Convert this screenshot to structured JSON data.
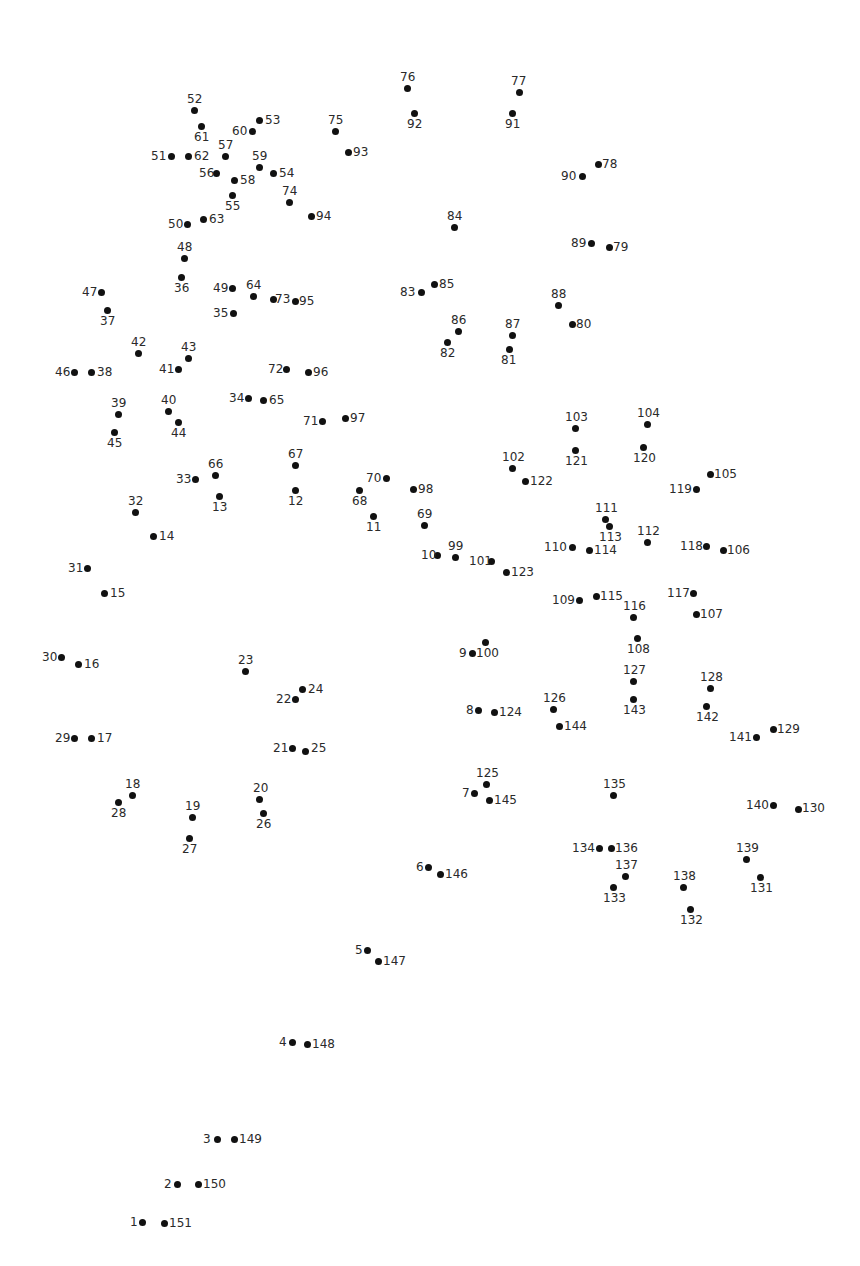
{
  "dot_count": 151,
  "dots": [
    {
      "n": "1",
      "x": 142,
      "y": 1222,
      "lx": 130,
      "ly": 1216
    },
    {
      "n": "2",
      "x": 177,
      "y": 1184,
      "lx": 164,
      "ly": 1178
    },
    {
      "n": "3",
      "x": 217,
      "y": 1139,
      "lx": 203,
      "ly": 1133
    },
    {
      "n": "4",
      "x": 292,
      "y": 1042,
      "lx": 279,
      "ly": 1036
    },
    {
      "n": "5",
      "x": 367,
      "y": 950,
      "lx": 355,
      "ly": 944
    },
    {
      "n": "6",
      "x": 428,
      "y": 867,
      "lx": 416,
      "ly": 861
    },
    {
      "n": "7",
      "x": 474,
      "y": 793,
      "lx": 462,
      "ly": 787
    },
    {
      "n": "8",
      "x": 478,
      "y": 710,
      "lx": 466,
      "ly": 704
    },
    {
      "n": "9",
      "x": 472,
      "y": 653,
      "lx": 459,
      "ly": 647
    },
    {
      "n": "10",
      "x": 437,
      "y": 555,
      "lx": 421,
      "ly": 549
    },
    {
      "n": "11",
      "x": 373,
      "y": 516,
      "lx": 366,
      "ly": 521
    },
    {
      "n": "12",
      "x": 295,
      "y": 490,
      "lx": 288,
      "ly": 495
    },
    {
      "n": "13",
      "x": 219,
      "y": 496,
      "lx": 212,
      "ly": 501
    },
    {
      "n": "14",
      "x": 153,
      "y": 536,
      "lx": 159,
      "ly": 530
    },
    {
      "n": "15",
      "x": 104,
      "y": 593,
      "lx": 110,
      "ly": 587
    },
    {
      "n": "16",
      "x": 78,
      "y": 664,
      "lx": 84,
      "ly": 658
    },
    {
      "n": "17",
      "x": 91,
      "y": 738,
      "lx": 97,
      "ly": 732
    },
    {
      "n": "18",
      "x": 132,
      "y": 795,
      "lx": 125,
      "ly": 778
    },
    {
      "n": "19",
      "x": 192,
      "y": 817,
      "lx": 185,
      "ly": 800
    },
    {
      "n": "20",
      "x": 259,
      "y": 799,
      "lx": 253,
      "ly": 782
    },
    {
      "n": "21",
      "x": 292,
      "y": 748,
      "lx": 273,
      "ly": 742
    },
    {
      "n": "22",
      "x": 295,
      "y": 699,
      "lx": 276,
      "ly": 693
    },
    {
      "n": "23",
      "x": 245,
      "y": 671,
      "lx": 238,
      "ly": 654
    },
    {
      "n": "24",
      "x": 302,
      "y": 689,
      "lx": 308,
      "ly": 683
    },
    {
      "n": "25",
      "x": 305,
      "y": 751,
      "lx": 311,
      "ly": 742
    },
    {
      "n": "26",
      "x": 263,
      "y": 813,
      "lx": 256,
      "ly": 818
    },
    {
      "n": "27",
      "x": 189,
      "y": 838,
      "lx": 182,
      "ly": 843
    },
    {
      "n": "28",
      "x": 118,
      "y": 802,
      "lx": 111,
      "ly": 807
    },
    {
      "n": "29",
      "x": 74,
      "y": 738,
      "lx": 55,
      "ly": 732
    },
    {
      "n": "30",
      "x": 61,
      "y": 657,
      "lx": 42,
      "ly": 651
    },
    {
      "n": "31",
      "x": 87,
      "y": 568,
      "lx": 68,
      "ly": 562
    },
    {
      "n": "32",
      "x": 135,
      "y": 512,
      "lx": 128,
      "ly": 495
    },
    {
      "n": "33",
      "x": 195,
      "y": 479,
      "lx": 176,
      "ly": 473
    },
    {
      "n": "34",
      "x": 248,
      "y": 398,
      "lx": 229,
      "ly": 392
    },
    {
      "n": "35",
      "x": 233,
      "y": 313,
      "lx": 213,
      "ly": 307
    },
    {
      "n": "36",
      "x": 181,
      "y": 277,
      "lx": 174,
      "ly": 282
    },
    {
      "n": "37",
      "x": 107,
      "y": 310,
      "lx": 100,
      "ly": 315
    },
    {
      "n": "38",
      "x": 91,
      "y": 372,
      "lx": 97,
      "ly": 366
    },
    {
      "n": "39",
      "x": 118,
      "y": 414,
      "lx": 111,
      "ly": 397
    },
    {
      "n": "40",
      "x": 168,
      "y": 411,
      "lx": 161,
      "ly": 394
    },
    {
      "n": "41",
      "x": 178,
      "y": 369,
      "lx": 159,
      "ly": 363
    },
    {
      "n": "42",
      "x": 138,
      "y": 353,
      "lx": 131,
      "ly": 336
    },
    {
      "n": "43",
      "x": 188,
      "y": 358,
      "lx": 181,
      "ly": 341
    },
    {
      "n": "44",
      "x": 178,
      "y": 422,
      "lx": 171,
      "ly": 427
    },
    {
      "n": "45",
      "x": 114,
      "y": 432,
      "lx": 107,
      "ly": 437
    },
    {
      "n": "46",
      "x": 74,
      "y": 372,
      "lx": 55,
      "ly": 366
    },
    {
      "n": "47",
      "x": 101,
      "y": 292,
      "lx": 82,
      "ly": 286
    },
    {
      "n": "48",
      "x": 184,
      "y": 258,
      "lx": 177,
      "ly": 241
    },
    {
      "n": "49",
      "x": 232,
      "y": 288,
      "lx": 213,
      "ly": 282
    },
    {
      "n": "50",
      "x": 187,
      "y": 224,
      "lx": 168,
      "ly": 218
    },
    {
      "n": "51",
      "x": 171,
      "y": 156,
      "lx": 151,
      "ly": 150
    },
    {
      "n": "52",
      "x": 194,
      "y": 110,
      "lx": 187,
      "ly": 93
    },
    {
      "n": "53",
      "x": 259,
      "y": 120,
      "lx": 265,
      "ly": 114
    },
    {
      "n": "54",
      "x": 273,
      "y": 173,
      "lx": 279,
      "ly": 167
    },
    {
      "n": "55",
      "x": 232,
      "y": 195,
      "lx": 225,
      "ly": 200
    },
    {
      "n": "56",
      "x": 216,
      "y": 173,
      "lx": 199,
      "ly": 167
    },
    {
      "n": "57",
      "x": 225,
      "y": 156,
      "lx": 218,
      "ly": 139
    },
    {
      "n": "58",
      "x": 234,
      "y": 180,
      "lx": 240,
      "ly": 174
    },
    {
      "n": "59",
      "x": 259,
      "y": 167,
      "lx": 252,
      "ly": 150
    },
    {
      "n": "60",
      "x": 252,
      "y": 131,
      "lx": 232,
      "ly": 125
    },
    {
      "n": "61",
      "x": 201,
      "y": 126,
      "lx": 194,
      "ly": 131
    },
    {
      "n": "62",
      "x": 188,
      "y": 156,
      "lx": 194,
      "ly": 150
    },
    {
      "n": "63",
      "x": 203,
      "y": 219,
      "lx": 209,
      "ly": 213
    },
    {
      "n": "64",
      "x": 253,
      "y": 296,
      "lx": 246,
      "ly": 279
    },
    {
      "n": "65",
      "x": 263,
      "y": 400,
      "lx": 269,
      "ly": 394
    },
    {
      "n": "66",
      "x": 215,
      "y": 475,
      "lx": 208,
      "ly": 458
    },
    {
      "n": "67",
      "x": 295,
      "y": 465,
      "lx": 288,
      "ly": 448
    },
    {
      "n": "68",
      "x": 359,
      "y": 490,
      "lx": 352,
      "ly": 495
    },
    {
      "n": "69",
      "x": 424,
      "y": 525,
      "lx": 417,
      "ly": 508
    },
    {
      "n": "70",
      "x": 386,
      "y": 478,
      "lx": 366,
      "ly": 472
    },
    {
      "n": "71",
      "x": 322,
      "y": 421,
      "lx": 303,
      "ly": 415
    },
    {
      "n": "72",
      "x": 286,
      "y": 369,
      "lx": 268,
      "ly": 363
    },
    {
      "n": "73",
      "x": 273,
      "y": 299,
      "lx": 275,
      "ly": 293
    },
    {
      "n": "74",
      "x": 289,
      "y": 202,
      "lx": 282,
      "ly": 185
    },
    {
      "n": "75",
      "x": 335,
      "y": 131,
      "lx": 328,
      "ly": 114
    },
    {
      "n": "76",
      "x": 407,
      "y": 88,
      "lx": 400,
      "ly": 71
    },
    {
      "n": "77",
      "x": 519,
      "y": 92,
      "lx": 511,
      "ly": 75
    },
    {
      "n": "78",
      "x": 598,
      "y": 164,
      "lx": 602,
      "ly": 158
    },
    {
      "n": "79",
      "x": 609,
      "y": 247,
      "lx": 613,
      "ly": 241
    },
    {
      "n": "80",
      "x": 572,
      "y": 324,
      "lx": 576,
      "ly": 318
    },
    {
      "n": "81",
      "x": 509,
      "y": 349,
      "lx": 501,
      "ly": 354
    },
    {
      "n": "82",
      "x": 447,
      "y": 342,
      "lx": 440,
      "ly": 347
    },
    {
      "n": "83",
      "x": 421,
      "y": 292,
      "lx": 400,
      "ly": 286
    },
    {
      "n": "84",
      "x": 454,
      "y": 227,
      "lx": 447,
      "ly": 210
    },
    {
      "n": "85",
      "x": 434,
      "y": 284,
      "lx": 439,
      "ly": 278
    },
    {
      "n": "86",
      "x": 458,
      "y": 331,
      "lx": 451,
      "ly": 314
    },
    {
      "n": "87",
      "x": 512,
      "y": 335,
      "lx": 505,
      "ly": 318
    },
    {
      "n": "88",
      "x": 558,
      "y": 305,
      "lx": 551,
      "ly": 288
    },
    {
      "n": "89",
      "x": 591,
      "y": 243,
      "lx": 571,
      "ly": 237
    },
    {
      "n": "90",
      "x": 582,
      "y": 176,
      "lx": 561,
      "ly": 170
    },
    {
      "n": "91",
      "x": 512,
      "y": 113,
      "lx": 505,
      "ly": 118
    },
    {
      "n": "92",
      "x": 414,
      "y": 113,
      "lx": 407,
      "ly": 118
    },
    {
      "n": "93",
      "x": 348,
      "y": 152,
      "lx": 353,
      "ly": 146
    },
    {
      "n": "94",
      "x": 311,
      "y": 216,
      "lx": 316,
      "ly": 210
    },
    {
      "n": "95",
      "x": 295,
      "y": 301,
      "lx": 299,
      "ly": 295
    },
    {
      "n": "96",
      "x": 308,
      "y": 372,
      "lx": 313,
      "ly": 366
    },
    {
      "n": "97",
      "x": 345,
      "y": 418,
      "lx": 350,
      "ly": 412
    },
    {
      "n": "98",
      "x": 413,
      "y": 489,
      "lx": 418,
      "ly": 483
    },
    {
      "n": "99",
      "x": 455,
      "y": 557,
      "lx": 448,
      "ly": 540
    },
    {
      "n": "100",
      "x": 485,
      "y": 642,
      "lx": 476,
      "ly": 647
    },
    {
      "n": "101",
      "x": 491,
      "y": 561,
      "lx": 469,
      "ly": 555
    },
    {
      "n": "102",
      "x": 512,
      "y": 468,
      "lx": 502,
      "ly": 451
    },
    {
      "n": "103",
      "x": 575,
      "y": 428,
      "lx": 565,
      "ly": 411
    },
    {
      "n": "104",
      "x": 647,
      "y": 424,
      "lx": 637,
      "ly": 407
    },
    {
      "n": "105",
      "x": 710,
      "y": 474,
      "lx": 714,
      "ly": 468
    },
    {
      "n": "106",
      "x": 723,
      "y": 550,
      "lx": 727,
      "ly": 544
    },
    {
      "n": "107",
      "x": 696,
      "y": 614,
      "lx": 700,
      "ly": 608
    },
    {
      "n": "108",
      "x": 637,
      "y": 638,
      "lx": 627,
      "ly": 643
    },
    {
      "n": "109",
      "x": 579,
      "y": 600,
      "lx": 552,
      "ly": 594
    },
    {
      "n": "110",
      "x": 572,
      "y": 547,
      "lx": 544,
      "ly": 541
    },
    {
      "n": "111",
      "x": 605,
      "y": 519,
      "lx": 595,
      "ly": 502
    },
    {
      "n": "112",
      "x": 647,
      "y": 542,
      "lx": 637,
      "ly": 525
    },
    {
      "n": "113",
      "x": 609,
      "y": 526,
      "lx": 599,
      "ly": 531
    },
    {
      "n": "114",
      "x": 589,
      "y": 550,
      "lx": 594,
      "ly": 544
    },
    {
      "n": "115",
      "x": 596,
      "y": 596,
      "lx": 600,
      "ly": 590
    },
    {
      "n": "116",
      "x": 633,
      "y": 617,
      "lx": 623,
      "ly": 600
    },
    {
      "n": "117",
      "x": 693,
      "y": 593,
      "lx": 667,
      "ly": 587
    },
    {
      "n": "118",
      "x": 706,
      "y": 546,
      "lx": 680,
      "ly": 540
    },
    {
      "n": "119",
      "x": 696,
      "y": 489,
      "lx": 669,
      "ly": 483
    },
    {
      "n": "120",
      "x": 643,
      "y": 447,
      "lx": 633,
      "ly": 452
    },
    {
      "n": "121",
      "x": 575,
      "y": 450,
      "lx": 565,
      "ly": 455
    },
    {
      "n": "122",
      "x": 525,
      "y": 481,
      "lx": 530,
      "ly": 475
    },
    {
      "n": "123",
      "x": 506,
      "y": 572,
      "lx": 511,
      "ly": 566
    },
    {
      "n": "124",
      "x": 494,
      "y": 712,
      "lx": 499,
      "ly": 706
    },
    {
      "n": "125",
      "x": 486,
      "y": 784,
      "lx": 476,
      "ly": 767
    },
    {
      "n": "126",
      "x": 553,
      "y": 709,
      "lx": 543,
      "ly": 692
    },
    {
      "n": "127",
      "x": 633,
      "y": 681,
      "lx": 623,
      "ly": 664
    },
    {
      "n": "128",
      "x": 710,
      "y": 688,
      "lx": 700,
      "ly": 671
    },
    {
      "n": "129",
      "x": 773,
      "y": 729,
      "lx": 777,
      "ly": 723
    },
    {
      "n": "130",
      "x": 798,
      "y": 809,
      "lx": 802,
      "ly": 802
    },
    {
      "n": "131",
      "x": 760,
      "y": 877,
      "lx": 750,
      "ly": 882
    },
    {
      "n": "132",
      "x": 690,
      "y": 909,
      "lx": 680,
      "ly": 914
    },
    {
      "n": "133",
      "x": 613,
      "y": 887,
      "lx": 603,
      "ly": 892
    },
    {
      "n": "134",
      "x": 599,
      "y": 848,
      "lx": 572,
      "ly": 842
    },
    {
      "n": "135",
      "x": 613,
      "y": 795,
      "lx": 603,
      "ly": 778
    },
    {
      "n": "136",
      "x": 611,
      "y": 848,
      "lx": 615,
      "ly": 842
    },
    {
      "n": "137",
      "x": 625,
      "y": 876,
      "lx": 615,
      "ly": 859
    },
    {
      "n": "138",
      "x": 683,
      "y": 887,
      "lx": 673,
      "ly": 870
    },
    {
      "n": "139",
      "x": 746,
      "y": 859,
      "lx": 736,
      "ly": 842
    },
    {
      "n": "140",
      "x": 773,
      "y": 805,
      "lx": 746,
      "ly": 799
    },
    {
      "n": "141",
      "x": 756,
      "y": 737,
      "lx": 729,
      "ly": 731
    },
    {
      "n": "142",
      "x": 706,
      "y": 706,
      "lx": 696,
      "ly": 711
    },
    {
      "n": "143",
      "x": 633,
      "y": 699,
      "lx": 623,
      "ly": 704
    },
    {
      "n": "144",
      "x": 559,
      "y": 726,
      "lx": 564,
      "ly": 720
    },
    {
      "n": "145",
      "x": 489,
      "y": 800,
      "lx": 494,
      "ly": 794
    },
    {
      "n": "146",
      "x": 440,
      "y": 874,
      "lx": 445,
      "ly": 868
    },
    {
      "n": "147",
      "x": 378,
      "y": 961,
      "lx": 383,
      "ly": 955
    },
    {
      "n": "148",
      "x": 307,
      "y": 1044,
      "lx": 312,
      "ly": 1038
    },
    {
      "n": "149",
      "x": 234,
      "y": 1139,
      "lx": 239,
      "ly": 1133
    },
    {
      "n": "150",
      "x": 198,
      "y": 1184,
      "lx": 203,
      "ly": 1178
    },
    {
      "n": "151",
      "x": 164,
      "y": 1223,
      "lx": 169,
      "ly": 1217
    }
  ]
}
